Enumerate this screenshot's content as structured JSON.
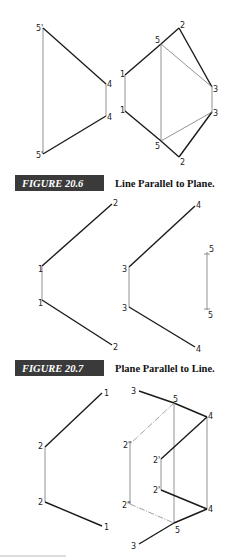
{
  "figures": [
    {
      "number": "FIGURE 20.6",
      "title": "Line Parallel to Plane.",
      "labels": {
        "top_5p": "5'",
        "bot_5p": "5'",
        "left_4a": "4",
        "left_4b": "4",
        "r_1a": "1",
        "r_1b": "1",
        "r_5a": "5",
        "r_5b": "5",
        "r_2a": "2",
        "r_2b": "2",
        "r_3a": "3",
        "r_3b": "3"
      }
    },
    {
      "number": "FIGURE 20.7",
      "title": "Plane Parallel to Line.",
      "labels": {
        "a_2top": "2",
        "a_1a": "1",
        "a_1b": "1",
        "a_2bot": "2",
        "b_4top": "4",
        "b_3a": "3",
        "b_3b": "3",
        "b_4bot": "4",
        "c_5top": "5",
        "c_5bot": "5"
      }
    },
    {
      "number": "",
      "title": "",
      "labels": {
        "a_1top": "1",
        "a_2a": "2",
        "a_2b": "2",
        "a_1bot": "1",
        "b_3top": "3",
        "b_5top": "5",
        "b_4top": "4",
        "b_2pp_top": "2\"",
        "b_2p_top": "2'",
        "b_2p_bot": "2'",
        "b_2pp_bot": "2\"",
        "b_4bot": "4",
        "b_5bot": "5",
        "b_3bot": "3"
      }
    }
  ],
  "colors": {
    "caption_bg": "#3a3a3a",
    "caption_fg": "#ffffff",
    "line_dark": "#1a1a1a",
    "line_light": "#777777"
  }
}
